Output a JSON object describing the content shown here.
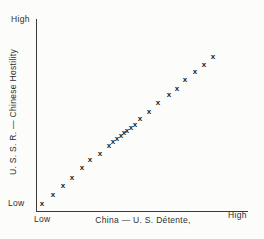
{
  "figure": {
    "background_color": "#fcfcfa",
    "ink_color": "#2b2b2b",
    "marker_glyph": "x"
  },
  "axis_labels": {
    "y_high": "High",
    "y_low": "Low",
    "x_low": "Low",
    "x_high": "High"
  },
  "chart_data": {
    "type": "scatter",
    "title": "",
    "xlabel": "China — U. S. Détente,",
    "ylabel": "U. S. S. R. — Chinese Hostility",
    "x_tick_labels": [
      "Low",
      "High"
    ],
    "y_tick_labels": [
      "Low",
      "High"
    ],
    "x_range": [
      0,
      1
    ],
    "y_range": [
      0,
      1
    ],
    "grid": false,
    "legend": "none",
    "marker": "x",
    "relationship": "positive linear correlation",
    "points": [
      [
        0.019,
        0.037
      ],
      [
        0.071,
        0.084
      ],
      [
        0.119,
        0.131
      ],
      [
        0.162,
        0.173
      ],
      [
        0.21,
        0.225
      ],
      [
        0.248,
        0.267
      ],
      [
        0.295,
        0.298
      ],
      [
        0.338,
        0.34
      ],
      [
        0.357,
        0.361
      ],
      [
        0.376,
        0.377
      ],
      [
        0.395,
        0.393
      ],
      [
        0.41,
        0.408
      ],
      [
        0.424,
        0.419
      ],
      [
        0.443,
        0.435
      ],
      [
        0.462,
        0.45
      ],
      [
        0.486,
        0.482
      ],
      [
        0.529,
        0.518
      ],
      [
        0.571,
        0.565
      ],
      [
        0.624,
        0.607
      ],
      [
        0.662,
        0.639
      ],
      [
        0.7,
        0.686
      ],
      [
        0.748,
        0.728
      ],
      [
        0.79,
        0.764
      ],
      [
        0.833,
        0.806
      ]
    ]
  },
  "plot_geometry": {
    "x_origin_px": 38,
    "x_span_px": 210,
    "y_origin_px": 211,
    "y_span_px": 191
  }
}
